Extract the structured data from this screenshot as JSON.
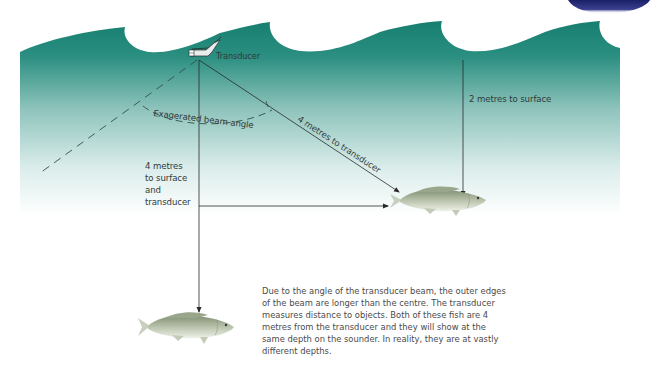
{
  "diagram": {
    "colors": {
      "water_top": "#1f8a7a",
      "water_bottom": "#ffffff",
      "line": "#2a2a2a",
      "logo_arc": "#2a2f7a",
      "fish_body": "#a9b49a",
      "fish_belly": "#e3e7da"
    },
    "labels": {
      "transducer": "Transducer",
      "beam_angle": "Exagerated beam angle",
      "diagonal_distance": "4 metres to transducer",
      "shallow_fish_depth": "2 metres to surface",
      "deep_fish_depth_lines": [
        "4 metres",
        "to surface",
        "and",
        "transducer"
      ]
    },
    "caption": "Due to the angle of the transducer beam, the outer edges of the beam are longer than the centre. The transducer measures distance to objects. Both of these fish are 4 metres from the transducer and they will show at the same depth on the sounder. In reality, they are at vastly different depths.",
    "icons": {
      "transducer": "transducer-icon",
      "fish_upper": "fish-icon",
      "fish_lower": "fish-icon",
      "logo": "logo-arc-icon"
    }
  }
}
